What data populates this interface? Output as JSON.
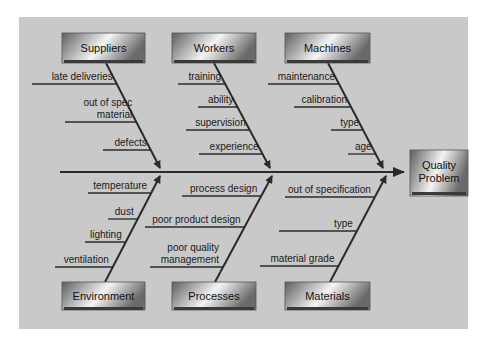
{
  "colors": {
    "panel": "#c9c9c9",
    "line": "#2b2b2b",
    "box_dark": "#5a5a5a",
    "box_light": "#f2f2f2"
  },
  "effect": {
    "label": "Quality Problem",
    "lines": [
      "Quality",
      "Problem"
    ]
  },
  "categories": [
    {
      "name": "Suppliers",
      "position": "top",
      "causes": [
        [
          "late deliveries"
        ],
        [
          "out of spec",
          "material"
        ],
        [
          "defects"
        ]
      ]
    },
    {
      "name": "Workers",
      "position": "top",
      "causes": [
        [
          "training"
        ],
        [
          "ability"
        ],
        [
          "supervision"
        ],
        [
          "experience"
        ]
      ]
    },
    {
      "name": "Machines",
      "position": "top",
      "causes": [
        [
          "maintenance"
        ],
        [
          "calibration"
        ],
        [
          "type"
        ],
        [
          "age"
        ]
      ]
    },
    {
      "name": "Environment",
      "position": "bottom",
      "causes": [
        [
          "temperature"
        ],
        [
          "dust"
        ],
        [
          "lighting"
        ],
        [
          "ventilation"
        ]
      ]
    },
    {
      "name": "Processes",
      "position": "bottom",
      "causes": [
        [
          "process design"
        ],
        [
          "poor product design"
        ],
        [
          "poor quality",
          "management"
        ]
      ]
    },
    {
      "name": "Materials",
      "position": "bottom",
      "causes": [
        [
          "out of specification"
        ],
        [
          "type"
        ],
        [
          "material grade"
        ]
      ]
    }
  ]
}
